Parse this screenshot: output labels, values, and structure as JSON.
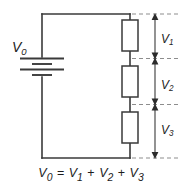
{
  "figure": {
    "background_color": "#ffffff",
    "wire_color": "#3a3a3a",
    "dash_color": "#8d8d8d",
    "text_color": "#1d1d1d",
    "width": 182,
    "height": 187
  },
  "source": {
    "label": "V",
    "subscript": "0",
    "type": "battery",
    "name": "voltage-source"
  },
  "components": [
    {
      "name": "resistor-r1",
      "type": "resistor",
      "voltage_label": "V",
      "voltage_subscript": "1"
    },
    {
      "name": "resistor-r2",
      "type": "resistor",
      "voltage_label": "V",
      "voltage_subscript": "2"
    },
    {
      "name": "resistor-r3",
      "type": "resistor",
      "voltage_label": "V",
      "voltage_subscript": "3"
    }
  ],
  "dimensions": [
    {
      "name": "dimension-v1",
      "label": "V",
      "subscript": "1"
    },
    {
      "name": "dimension-v2",
      "label": "V",
      "subscript": "2"
    },
    {
      "name": "dimension-v3",
      "label": "V",
      "subscript": "3"
    }
  ],
  "equation": {
    "lhs": "V",
    "lhs_sub": "0",
    "eq": "=",
    "t1": "V",
    "t1_sub": "1",
    "plus1": "+",
    "t2": "V",
    "t2_sub": "2",
    "plus2": "+",
    "t3": "V",
    "t3_sub": "3",
    "full_text": "V0 = V1 + V2 + V3"
  }
}
